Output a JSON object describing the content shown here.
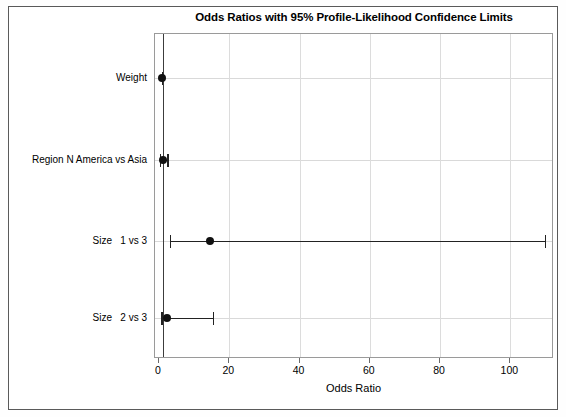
{
  "chart_data": {
    "type": "scatter",
    "subtype": "forest-plot",
    "title": "Odds Ratios with 95% Profile-Likelihood Confidence Limits",
    "xlabel": "Odds Ratio",
    "ylabel": "",
    "xlim": [
      0,
      111
    ],
    "ylim": [
      0,
      5
    ],
    "grid": true,
    "legend": false,
    "reference_line": 1,
    "xticks": [
      0,
      20,
      40,
      60,
      80,
      100
    ],
    "xticklabels": [
      "0",
      "20",
      "40",
      "60",
      "80",
      "100"
    ],
    "categories": [
      "Weight",
      "Region N America vs Asia",
      "Size   1 vs 3",
      "Size   2 vs 3"
    ],
    "estimates": [
      0.98,
      1.0,
      14.6,
      2.2
    ],
    "ci_lower": [
      0.96,
      0.4,
      3.3,
      0.9
    ],
    "ci_upper": [
      1.0,
      2.6,
      110.0,
      15.5
    ],
    "points": [
      {
        "label": "Weight",
        "odds_ratio": 0.98,
        "lower": 0.96,
        "upper": 1.0
      },
      {
        "label": "Region N America vs Asia",
        "odds_ratio": 1.0,
        "lower": 0.4,
        "upper": 2.6
      },
      {
        "label": "Size   1 vs 3",
        "odds_ratio": 14.6,
        "lower": 3.3,
        "upper": 110.0
      },
      {
        "label": "Size   2 vs 3",
        "odds_ratio": 2.2,
        "lower": 0.9,
        "upper": 15.5
      }
    ],
    "colors": {
      "marker": "#111111",
      "line": "#222222",
      "grid": "#d9d9d9",
      "reference": "#3c3c3c",
      "frame": "#5a5a5a"
    }
  }
}
